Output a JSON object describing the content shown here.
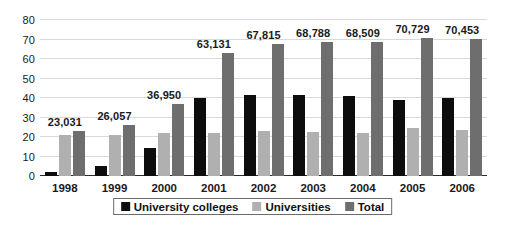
{
  "chart_data": {
    "type": "bar",
    "title": "",
    "subtitle": "",
    "xlabel": "",
    "ylabel": "",
    "ylim": [
      0,
      80
    ],
    "yticks": [
      0,
      10,
      20,
      30,
      40,
      50,
      60,
      70,
      80
    ],
    "ytick_labels": [
      "0",
      "10",
      "20",
      "30",
      "40",
      "50",
      "60",
      "70",
      "80"
    ],
    "grid": true,
    "legend_position": "bottom",
    "categories": [
      "1998",
      "1999",
      "2000",
      "2001",
      "2002",
      "2003",
      "2004",
      "2005",
      "2006"
    ],
    "series": [
      {
        "name": "University colleges",
        "color": "#0d0d0d",
        "values": [
          2.0,
          5.1,
          14.5,
          39.8,
          41.3,
          41.6,
          41.0,
          38.9,
          40.2
        ]
      },
      {
        "name": "Universities",
        "color": "#b0b0b0",
        "values": [
          21.0,
          21.0,
          22.2,
          22.0,
          23.2,
          22.7,
          22.2,
          24.8,
          23.7
        ]
      },
      {
        "name": "Total",
        "color": "#6e6e6e",
        "values": [
          23.031,
          26.057,
          36.95,
          63.131,
          67.815,
          68.788,
          68.509,
          70.729,
          70.453
        ]
      }
    ],
    "value_labels": {
      "series": "Total",
      "values": [
        "23,031",
        "26,057",
        "36,950",
        "63,131",
        "67,815",
        "68,788",
        "68,509",
        "70,729",
        "70,453"
      ]
    }
  },
  "legend": {
    "items": [
      {
        "label": "University colleges",
        "color": "#0d0d0d",
        "key": "university-colleges"
      },
      {
        "label": "Universities",
        "color": "#b0b0b0",
        "key": "universities"
      },
      {
        "label": "Total",
        "color": "#6e6e6e",
        "key": "total"
      }
    ]
  },
  "colors": {
    "university_colleges": "#0d0d0d",
    "universities": "#b0b0b0",
    "total": "#6e6e6e",
    "gridline": "#d9d9d9",
    "axis": "#2b2b2b",
    "background": "#ffffff",
    "text": "#1a1a1a"
  }
}
